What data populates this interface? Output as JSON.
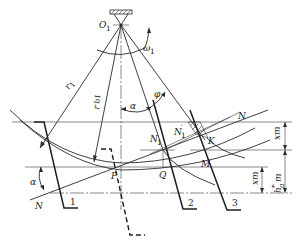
{
  "diagram": {
    "type": "gear-generation-geometry",
    "labels": {
      "pivot": "O",
      "pivot_sub": "1",
      "omega": "ω",
      "omega_sub": "1",
      "r1": "r",
      "r1_sub": "1",
      "rb1": "r",
      "rb1_sub": "b1",
      "alpha_top": "α",
      "phi": "φ",
      "alpha_left": "α",
      "N_left": "N",
      "N_right": "N",
      "N1": "N",
      "N1_sub": "1",
      "N1p": "N",
      "N1p_sub": "1",
      "N1p_sup": "′",
      "K": "K",
      "M": "M",
      "Q": "Q",
      "P": "P",
      "tool1": "1",
      "tool2": "2",
      "tool3": "3",
      "dim_xm_top": "xm",
      "dim_ha": "h",
      "dim_ha_sup": "*",
      "dim_ha_sub": "a",
      "dim_ha_m": "m",
      "dim_xm_bottom": "xm"
    },
    "colors": {
      "line": "#2a2a2a",
      "background": "#ffffff"
    }
  }
}
